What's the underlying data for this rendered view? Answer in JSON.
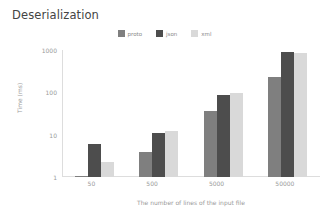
{
  "chart_data": {
    "type": "bar",
    "title": "Deserialization",
    "xlabel": "The number of lines of the input file",
    "ylabel": "Time (ms)",
    "categories": [
      "50",
      "500",
      "5000",
      "50000"
    ],
    "yscale": "log",
    "ylim": [
      1,
      1000
    ],
    "yticks": [
      "1",
      "10",
      "100",
      "1000"
    ],
    "grid": false,
    "legend_position": "top-center",
    "series": [
      {
        "name": "proto",
        "color": "#7f7f7f",
        "values": [
          1.05,
          4,
          36,
          230
        ]
      },
      {
        "name": "json",
        "color": "#4d4d4d",
        "values": [
          6,
          11,
          85,
          900
        ]
      },
      {
        "name": "xml",
        "color": "#d9d9d9",
        "values": [
          2.3,
          12.5,
          98,
          850
        ]
      }
    ]
  },
  "legend": {
    "items": [
      {
        "label": "proto",
        "swatch": "#7f7f7f"
      },
      {
        "label": "json",
        "swatch": "#4d4d4d"
      },
      {
        "label": "xml",
        "swatch": "#d9d9d9"
      }
    ]
  },
  "colors": {
    "background": "#ffffff",
    "title_text": "#444444",
    "axis_text": "#9a9a9a",
    "axis_line": "#dddddd"
  }
}
